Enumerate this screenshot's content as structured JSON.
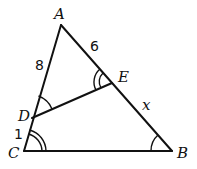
{
  "figure": {
    "points": {
      "A": {
        "label": "A",
        "x": 61,
        "y": 25
      },
      "B": {
        "label": "B",
        "x": 172,
        "y": 151
      },
      "C": {
        "label": "C",
        "x": 24,
        "y": 151
      },
      "D": {
        "label": "D",
        "x": 32,
        "y": 118
      },
      "E": {
        "label": "E",
        "x": 112,
        "y": 83
      }
    },
    "segments": [
      "AB",
      "BC",
      "CA",
      "DE"
    ],
    "lengths": {
      "AD": "8",
      "AE": "6",
      "DC": "1",
      "EB": "x"
    },
    "angle_marks": {
      "ADE": "single arc",
      "ABC": "single arc",
      "AED": "double arc",
      "ACB": "double arc"
    }
  }
}
